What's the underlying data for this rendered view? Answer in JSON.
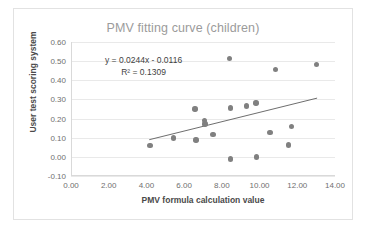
{
  "chart_data": {
    "type": "scatter",
    "title": "PMV fitting curve (children)",
    "xlabel": "PMV formula calculation value",
    "ylabel": "User test scoring system",
    "xlim": [
      0.0,
      14.0
    ],
    "ylim": [
      -0.1,
      0.6
    ],
    "xticks": [
      "0.00",
      "2.00",
      "4.00",
      "6.00",
      "8.00",
      "10.00",
      "12.00",
      "14.00"
    ],
    "xtick_values": [
      0,
      2,
      4,
      6,
      8,
      10,
      12,
      14
    ],
    "yticks": [
      "-0.10",
      "0.00",
      "0.10",
      "0.20",
      "0.30",
      "0.40",
      "0.50",
      "0.60"
    ],
    "ytick_values": [
      -0.1,
      0.0,
      0.1,
      0.2,
      0.3,
      0.4,
      0.5,
      0.6
    ],
    "grid": "horizontal",
    "legend": "none",
    "marker_color": "#808080",
    "trendline_color": "#6e6e6e",
    "annotations": [
      "y = 0.0244x - 0.0116",
      "R² = 0.1309"
    ],
    "equation": "y = 0.0244x - 0.0116",
    "r_squared": "R² = 0.1309",
    "slope": 0.0244,
    "intercept": -0.0116,
    "trendline": {
      "x_start": 4.15,
      "x_end": 13.05
    },
    "points": [
      {
        "x": 4.18,
        "y": 0.058
      },
      {
        "x": 5.42,
        "y": 0.098
      },
      {
        "x": 6.58,
        "y": 0.25
      },
      {
        "x": 6.62,
        "y": 0.088
      },
      {
        "x": 7.08,
        "y": 0.19
      },
      {
        "x": 7.1,
        "y": 0.172
      },
      {
        "x": 7.52,
        "y": 0.118
      },
      {
        "x": 8.42,
        "y": 0.515
      },
      {
        "x": 8.45,
        "y": 0.255
      },
      {
        "x": 8.46,
        "y": -0.012
      },
      {
        "x": 9.32,
        "y": 0.265
      },
      {
        "x": 9.82,
        "y": 0.282
      },
      {
        "x": 9.84,
        "y": 0.0
      },
      {
        "x": 10.55,
        "y": 0.126
      },
      {
        "x": 10.86,
        "y": 0.455
      },
      {
        "x": 11.52,
        "y": 0.062
      },
      {
        "x": 11.7,
        "y": 0.158
      },
      {
        "x": 13.02,
        "y": 0.482
      }
    ]
  }
}
